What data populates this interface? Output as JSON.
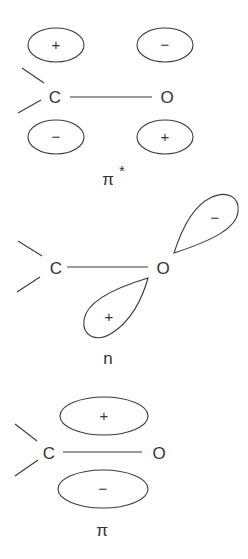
{
  "figure": {
    "colors": {
      "stroke": "#3a3a3a",
      "text": "#333333",
      "background": "#ffffff"
    },
    "panels": [
      {
        "id": "pi-star",
        "label": "π",
        "label_superscript": "*",
        "atoms": {
          "left": "C",
          "right": "O"
        },
        "lobes": [
          {
            "position": "upper-left (on C)",
            "sign": "+"
          },
          {
            "position": "upper-right (on O)",
            "sign": "−"
          },
          {
            "position": "lower-left (on C)",
            "sign": "−"
          },
          {
            "position": "lower-right (on O)",
            "sign": "+"
          }
        ]
      },
      {
        "id": "n",
        "label": "n",
        "atoms": {
          "left": "C",
          "right": "O"
        },
        "lobes": [
          {
            "position": "upper-right sp lobe on O",
            "sign": "−"
          },
          {
            "position": "lower-left sp lobe on O",
            "sign": "+"
          }
        ]
      },
      {
        "id": "pi",
        "label": "π",
        "atoms": {
          "left": "C",
          "right": "O"
        },
        "lobes": [
          {
            "position": "above C–O bond",
            "sign": "+"
          },
          {
            "position": "below C–O bond",
            "sign": "−"
          }
        ]
      }
    ]
  }
}
